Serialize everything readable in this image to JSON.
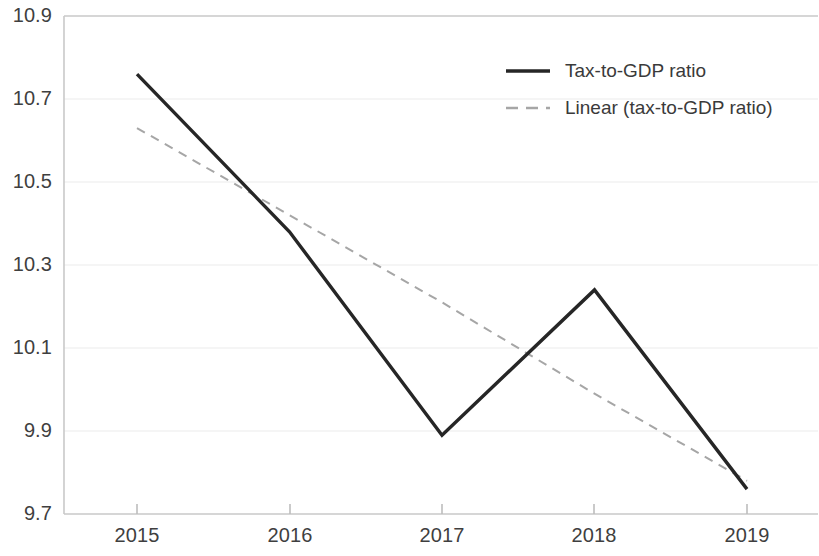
{
  "chart_data": {
    "type": "line",
    "title": "",
    "xlabel": "",
    "ylabel": "",
    "x": [
      "2015",
      "2016",
      "2017",
      "2018",
      "2019"
    ],
    "categories": [
      "2015",
      "2016",
      "2017",
      "2018",
      "2019"
    ],
    "xtick_labels": [
      "2015",
      "2016",
      "2017",
      "2018",
      "2019"
    ],
    "ytick_labels": [
      "10.9",
      "10.7",
      "10.5",
      "10.3",
      "10.1",
      "9.9",
      "9.7"
    ],
    "ytick_values": [
      10.9,
      10.7,
      10.5,
      10.3,
      10.1,
      9.9,
      9.7
    ],
    "ylim": [
      9.7,
      10.9
    ],
    "grid": "horizontal",
    "legend_position": "top-right-inside",
    "series": [
      {
        "name": "Tax-to-GDP ratio",
        "style": "solid",
        "color": "#262626",
        "values": [
          10.76,
          10.38,
          9.89,
          10.24,
          9.76
        ]
      },
      {
        "name": "Linear (tax-to-GDP ratio)",
        "style": "dashed",
        "color": "#a6a6a6",
        "values": [
          10.63,
          10.42,
          10.21,
          9.99,
          9.78
        ]
      }
    ]
  },
  "legend": {
    "items": [
      {
        "label": "Tax-to-GDP ratio",
        "swatch": "solid-line-swatch"
      },
      {
        "label": "Linear (tax-to-GDP ratio)",
        "swatch": "dashed-line-swatch"
      }
    ]
  },
  "axes": {
    "y": {
      "labels": [
        "10.9",
        "10.7",
        "10.5",
        "10.3",
        "10.1",
        "9.9",
        "9.7"
      ]
    },
    "x": {
      "labels": [
        "2015",
        "2016",
        "2017",
        "2018",
        "2019"
      ]
    }
  },
  "colors": {
    "series_line": "#262626",
    "trend_line": "#a6a6a6",
    "grid": "#e8e8e8",
    "axis": "#bfbfbf",
    "text": "#3a3a3a",
    "background": "#ffffff"
  }
}
